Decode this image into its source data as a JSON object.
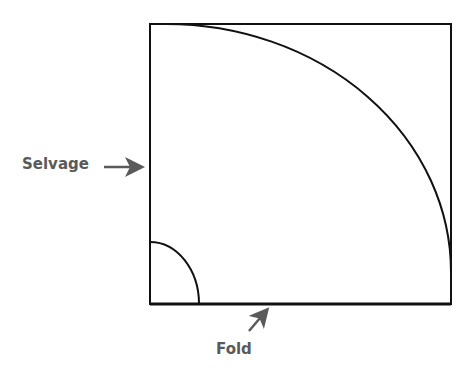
{
  "diagram": {
    "type": "fabric-layout",
    "labels": {
      "selvage": "Selvage",
      "fold": "Fold"
    },
    "shapes": {
      "rectangle": {
        "x1": 150,
        "y1": 24,
        "x2": 451,
        "y2": 304
      },
      "large_arc": {
        "start": [
          166,
          24
        ],
        "end": [
          451,
          272
        ],
        "center": [
          166,
          272
        ]
      },
      "small_arc": {
        "start": [
          150,
          242
        ],
        "end": [
          199,
          304
        ],
        "center": [
          150,
          304
        ]
      }
    },
    "arrows": {
      "selvage": {
        "from": [
          104,
          167
        ],
        "to": [
          145,
          167
        ]
      },
      "fold": {
        "from": [
          249,
          331
        ],
        "to": [
          270,
          307
        ]
      }
    },
    "colors": {
      "line": "#111111",
      "label": "#5a5a5a",
      "arrow": "#5a5a5a",
      "background": "#ffffff"
    }
  }
}
